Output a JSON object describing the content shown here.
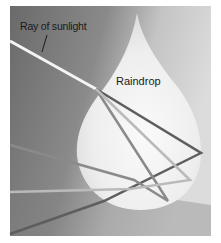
{
  "diagram": {
    "labels": {
      "ray": "Ray of sunlight",
      "raindrop": "Raindrop"
    },
    "colors": {
      "background_dark": "#6e6e6e",
      "background_light": "#d6d6d6",
      "drop_fill": "#f4f4f4",
      "sunlight_ray": "#f2f2f2",
      "refracted_dark": "#5a5a5a",
      "refracted_mid": "#8c8c8c",
      "refracted_light": "#bdbdbd"
    },
    "elements": [
      "incoming white sunlight ray",
      "raindrop shape",
      "refracted ray paths (dark, mid, light gray)",
      "exiting dispersed rays"
    ]
  }
}
